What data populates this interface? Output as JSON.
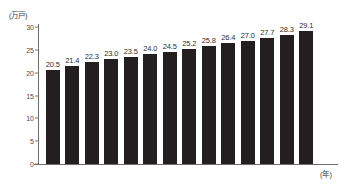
{
  "chart_data": {
    "type": "bar",
    "title": "",
    "subtitle": "",
    "xlabel": "(年)",
    "ylabel": "(万戸)",
    "categories": [
      "2005",
      "2006",
      "2007",
      "2008",
      "2009",
      "2010",
      "2011",
      "2012",
      "2013",
      "2014",
      "2015",
      "2016",
      "2017",
      "2018"
    ],
    "values": [
      20.5,
      21.4,
      22.3,
      23.0,
      23.5,
      24.0,
      24.5,
      25.2,
      25.8,
      26.4,
      27.0,
      27.7,
      28.3,
      29.1
    ],
    "value_labels": [
      "20.5",
      "21.4",
      "22.3",
      "23.0",
      "23.5",
      "24.0",
      "24.5",
      "25.2",
      "25.8",
      "26.4",
      "27.0",
      "27.7",
      "28.3",
      "29.1"
    ],
    "ylim": [
      0,
      30
    ],
    "yticks": [
      0,
      5,
      10,
      15,
      20,
      25,
      30
    ],
    "ytick_labels": [
      "0",
      "5",
      "10",
      "15",
      "20",
      "25",
      "30"
    ],
    "grid": false,
    "legend": null,
    "bar_color": "#231f20",
    "axis_color": "#6e6e6e",
    "text_color": "#2e2e2e"
  }
}
